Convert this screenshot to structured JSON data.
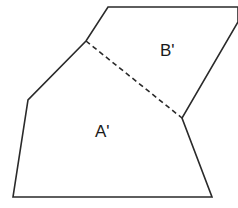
{
  "diagram": {
    "regions": [
      {
        "id": "A",
        "label": "A'"
      },
      {
        "id": "B",
        "label": "B'"
      }
    ],
    "outline_points": "108,7 238,7 238,22 182,118 212,197 13,197 28,100 86,41",
    "divider": {
      "x1": 86,
      "y1": 41,
      "x2": 182,
      "y2": 118,
      "style": "dashed"
    },
    "line_color": "#2a2a2a"
  }
}
